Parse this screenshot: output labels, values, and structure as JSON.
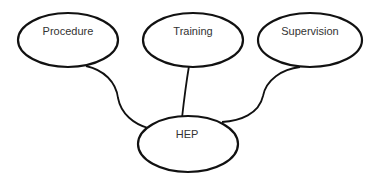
{
  "diagram": {
    "type": "influence-diagram",
    "nodes": [
      {
        "id": "procedure",
        "label": "Procedure",
        "cx": 68,
        "cy": 40,
        "rx": 50,
        "ry": 27,
        "label_y": 35
      },
      {
        "id": "training",
        "label": "Training",
        "cx": 193,
        "cy": 40,
        "rx": 50,
        "ry": 27,
        "label_y": 35
      },
      {
        "id": "supervision",
        "label": "Supervision",
        "cx": 310,
        "cy": 40,
        "rx": 52,
        "ry": 27,
        "label_y": 35
      },
      {
        "id": "hep",
        "label": "HEP",
        "cx": 188,
        "cy": 144,
        "rx": 50,
        "ry": 28,
        "label_y": 138
      }
    ],
    "edges": [
      {
        "from": "procedure",
        "to": "hep"
      },
      {
        "from": "training",
        "to": "hep"
      },
      {
        "from": "supervision",
        "to": "hep"
      }
    ]
  },
  "colors": {
    "stroke": "#111111",
    "text": "#333333",
    "background": "#ffffff"
  }
}
